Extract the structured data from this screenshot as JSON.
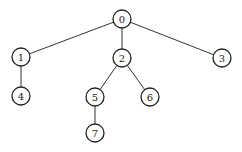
{
  "diagram": {
    "type": "tree",
    "node_radius": 9,
    "nodes": [
      {
        "id": "0",
        "label": "0",
        "x": 122,
        "y": 19
      },
      {
        "id": "1",
        "label": "1",
        "x": 21,
        "y": 57
      },
      {
        "id": "2",
        "label": "2",
        "x": 122,
        "y": 58
      },
      {
        "id": "3",
        "label": "3",
        "x": 222,
        "y": 58
      },
      {
        "id": "4",
        "label": "4",
        "x": 21,
        "y": 96
      },
      {
        "id": "5",
        "label": "5",
        "x": 95,
        "y": 97
      },
      {
        "id": "6",
        "label": "6",
        "x": 150,
        "y": 97
      },
      {
        "id": "7",
        "label": "7",
        "x": 95,
        "y": 133
      }
    ],
    "edges": [
      {
        "from": "0",
        "to": "1"
      },
      {
        "from": "0",
        "to": "2"
      },
      {
        "from": "0",
        "to": "3"
      },
      {
        "from": "1",
        "to": "4"
      },
      {
        "from": "2",
        "to": "5"
      },
      {
        "from": "2",
        "to": "6"
      },
      {
        "from": "5",
        "to": "7"
      }
    ]
  }
}
